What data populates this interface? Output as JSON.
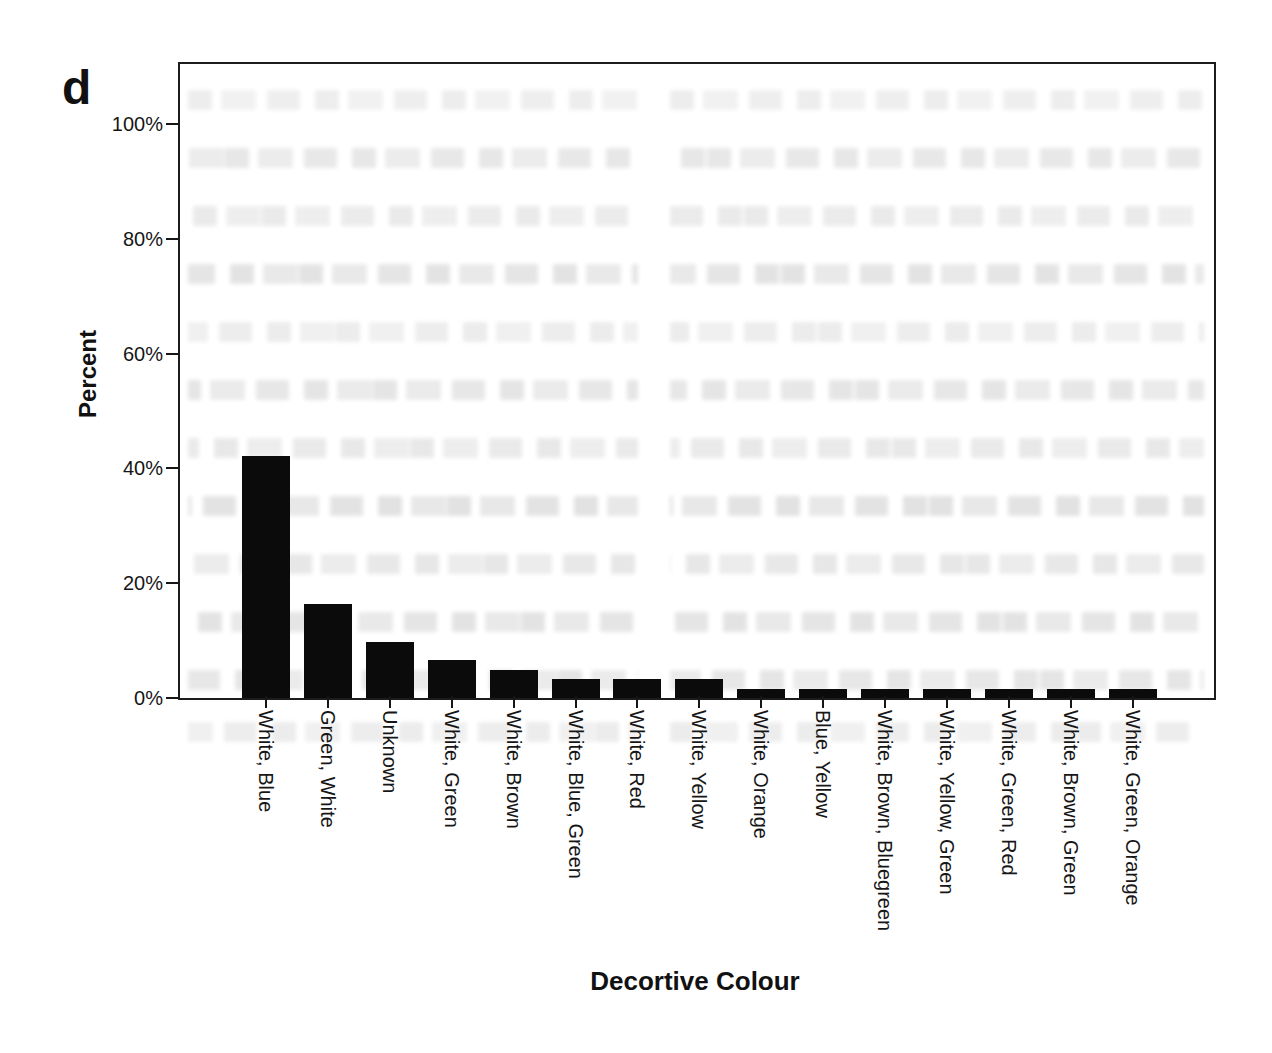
{
  "figure": {
    "panel_label": "d"
  },
  "chart_data": {
    "type": "bar",
    "title": "",
    "xlabel": "Decortive Colour",
    "ylabel": "Percent",
    "categories": [
      "White, Blue",
      "Green, White",
      "Unknown",
      "White, Green",
      "White, Brown",
      "White, Blue, Green",
      "White, Red",
      "White, Yellow",
      "White, Orange",
      "Blue, Yellow",
      "White, Brown, Bluegreen",
      "White, Yellow, Green",
      "White, Green, Red",
      "White, Brown, Green",
      "White, Green, Orange"
    ],
    "values": [
      42.2,
      16.4,
      9.8,
      6.6,
      4.9,
      3.3,
      3.3,
      3.3,
      1.6,
      1.6,
      1.6,
      1.6,
      1.6,
      1.6,
      1.6
    ],
    "y_ticks": [
      {
        "label": "0%",
        "value": 0
      },
      {
        "label": "20%",
        "value": 20
      },
      {
        "label": "40%",
        "value": 40
      },
      {
        "label": "60%",
        "value": 60
      },
      {
        "label": "80%",
        "value": 80
      },
      {
        "label": "100%",
        "value": 100
      }
    ],
    "ylim": [
      0,
      110
    ],
    "grid": false,
    "legend": null,
    "bar_color": "#0b0b0b",
    "axis_color": "#1c1c1c"
  }
}
